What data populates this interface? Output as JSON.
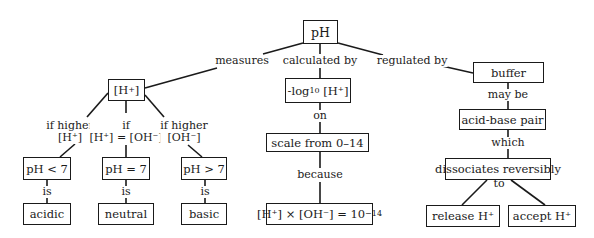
{
  "concept_map": {
    "root": {
      "label": "pH"
    },
    "links_top": {
      "measures": "measures",
      "calculated_by": "calculated by",
      "regulated_by": "regulated by"
    },
    "hplus": {
      "label_main": "[H",
      "label_sup": "+",
      "label_end": "]"
    },
    "hplus_branches": {
      "left": {
        "line1": "if higher",
        "line2": "[H⁺]"
      },
      "middle": {
        "line1": "if",
        "line2": "[H⁺] = [OH⁻]"
      },
      "right": {
        "line1": "if higher",
        "line2": "[OH⁻]"
      }
    },
    "ph_nodes": {
      "lt": "pH < 7",
      "eq": "pH = 7",
      "gt": "pH > 7"
    },
    "is_label": "is",
    "result_nodes": {
      "acidic": "acidic",
      "neutral": "neutral",
      "basic": "basic"
    },
    "calc": {
      "log_prefix": "-log",
      "log_sub": "10",
      "log_suffix": " [H⁺]",
      "on_label": "on",
      "scale": "scale from 0–14",
      "because_label": "because",
      "kw_main": "[H⁺] × [OH⁻] = 10",
      "kw_sup": "−14"
    },
    "buffer": {
      "label": "buffer",
      "may_be": "may be",
      "pair": "acid-base pair",
      "which": "which",
      "dissociates": "dissociates reversibly",
      "to": "to",
      "release": "release H⁺",
      "accept": "accept H⁺"
    }
  }
}
